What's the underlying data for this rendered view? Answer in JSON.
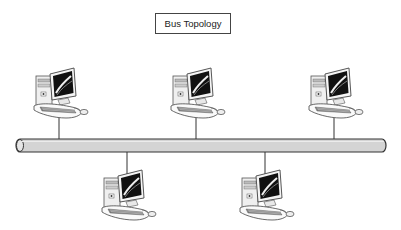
{
  "diagram": {
    "title": "Bus Topology",
    "type": "network-topology",
    "bus": {
      "label": "",
      "fill_color": "#d4d4d4",
      "stroke_color": "#333333"
    },
    "nodes": [
      {
        "id": "computer-1",
        "kind": "desktop-computer",
        "position": "top",
        "drop_x": 59
      },
      {
        "id": "computer-2",
        "kind": "desktop-computer",
        "position": "top",
        "drop_x": 196
      },
      {
        "id": "computer-3",
        "kind": "desktop-computer",
        "position": "top",
        "drop_x": 334
      },
      {
        "id": "computer-4",
        "kind": "desktop-computer",
        "position": "bottom",
        "drop_x": 127
      },
      {
        "id": "computer-5",
        "kind": "desktop-computer",
        "position": "bottom",
        "drop_x": 265
      }
    ],
    "edges": [
      {
        "from": "computer-1",
        "to": "bus"
      },
      {
        "from": "computer-2",
        "to": "bus"
      },
      {
        "from": "computer-3",
        "to": "bus"
      },
      {
        "from": "computer-4",
        "to": "bus"
      },
      {
        "from": "computer-5",
        "to": "bus"
      }
    ]
  }
}
